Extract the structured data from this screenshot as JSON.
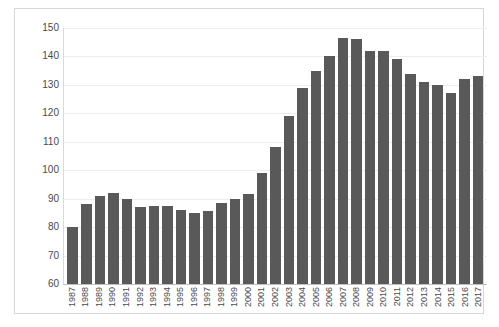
{
  "chart_data": {
    "type": "bar",
    "title": "",
    "subtitle": "",
    "xlabel": "",
    "ylabel": "",
    "ylim": [
      60,
      150
    ],
    "y_ticks": [
      60,
      70,
      80,
      90,
      100,
      110,
      120,
      130,
      140,
      150
    ],
    "grid": true,
    "legend": null,
    "bar_color": "#595959",
    "gridline_color": "#ededed",
    "axis_color": "#bfbfbf",
    "frame_color": "#d6d6d6",
    "categories": [
      "1987",
      "1988",
      "1989",
      "1990",
      "1991",
      "1992",
      "1993",
      "1994",
      "1995",
      "1996",
      "1997",
      "1998",
      "1999",
      "2000",
      "2001",
      "2002",
      "2003",
      "2004",
      "2005",
      "2006",
      "2007",
      "2008",
      "2009",
      "2010",
      "2011",
      "2012",
      "2013",
      "2014",
      "2015",
      "2016",
      "2017"
    ],
    "values": [
      80,
      88,
      91,
      92,
      90,
      87,
      87.5,
      87.5,
      86,
      85,
      85.5,
      88.5,
      90,
      91.5,
      99,
      108,
      119,
      129,
      135,
      140,
      146.5,
      146,
      142,
      142,
      139,
      134,
      131,
      130,
      127,
      132,
      133
    ]
  }
}
